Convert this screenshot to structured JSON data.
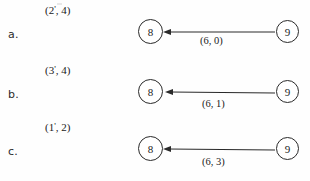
{
  "document": {
    "type": "scanned-figure",
    "background_color": "#fefefe",
    "ink_color": "#1a1a1a"
  },
  "rows": [
    {
      "label": "a.",
      "pair_label": {
        "open": "(",
        "first": "2",
        "prime": "'",
        "separator": ",",
        "second": "4",
        "close": ")",
        "text": "(2', 4)"
      },
      "nodes": {
        "left": "8",
        "right": "9"
      },
      "edge": {
        "label": "(6, 0)",
        "direction": "right-to-left"
      }
    },
    {
      "label": "b.",
      "pair_label": {
        "open": "(",
        "first": "3",
        "prime": "'",
        "separator": ",",
        "second": "4",
        "close": ")",
        "text": "(3', 4)"
      },
      "nodes": {
        "left": "8",
        "right": "9"
      },
      "edge": {
        "label": "(6, 1)",
        "direction": "right-to-left"
      }
    },
    {
      "label": "c.",
      "pair_label": {
        "open": "(",
        "first": "1",
        "prime": "'",
        "separator": ",",
        "second": "2",
        "close": ")",
        "text": "(1', 2)"
      },
      "nodes": {
        "left": "8",
        "right": "9"
      },
      "edge": {
        "label": "(6, 3)",
        "direction": "right-to-left"
      }
    }
  ]
}
